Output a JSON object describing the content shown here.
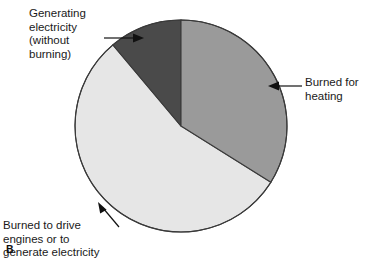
{
  "figure": {
    "panel_label": "B",
    "background_color": "#ffffff"
  },
  "callouts": {
    "generating": "Generating\nelectricity\n(without\nburning)",
    "heating": "Burned for\nheating",
    "engines": "Burned to drive\nengines or to\ngenerate electricity"
  },
  "chart_data": {
    "type": "pie",
    "title": "",
    "subtitle": "",
    "xlabel": "",
    "ylabel": "",
    "legend_position": "callout-labels",
    "grid": false,
    "start_angle_deg": 0,
    "direction": "clockwise",
    "center": {
      "x": 181,
      "y": 126
    },
    "radius": 106,
    "categories": [
      "Burned for heating",
      "Burned to drive engines or to generate electricity",
      "Generating electricity (without burning)"
    ],
    "values": [
      34,
      55,
      11
    ],
    "units": "percent",
    "slices": [
      {
        "label": "Burned for heating",
        "value": 34,
        "color": "#9a9a9a",
        "start_deg": 0,
        "end_deg": 122
      },
      {
        "label": "Burned to drive engines or to generate electricity",
        "value": 55,
        "color": "#e6e6e6",
        "start_deg": 122,
        "end_deg": 320
      },
      {
        "label": "Generating electricity (without burning)",
        "value": 11,
        "color": "#4a4a4a",
        "start_deg": 320,
        "end_deg": 360
      }
    ],
    "colors": {
      "burned_for_heating": "#9a9a9a",
      "burned_to_drive_engines": "#e6e6e6",
      "generating_electricity": "#4a4a4a",
      "outline": "#3a3a3a",
      "leader_line": "#111111",
      "text": "#1a1a1a"
    }
  }
}
